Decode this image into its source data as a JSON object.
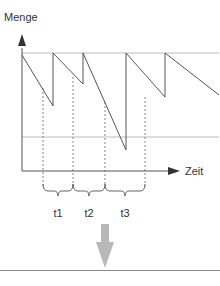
{
  "diagram": {
    "y_axis_label": "Menge",
    "x_axis_label": "Zeit",
    "intervals": [
      {
        "label": "t1"
      },
      {
        "label": "t2"
      },
      {
        "label": "t3"
      }
    ],
    "colors": {
      "line": "#555555",
      "guide": "#bbbbbb",
      "arrow_down": "#b8b8b8",
      "separator": "#888888"
    }
  }
}
